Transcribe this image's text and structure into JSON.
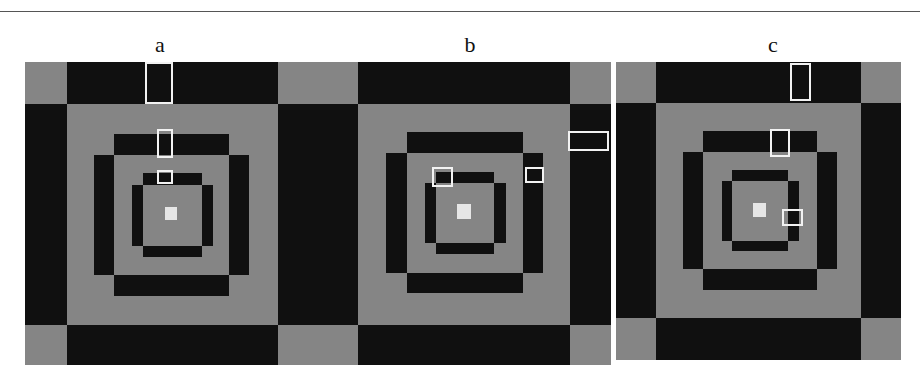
{
  "figure": {
    "panels": [
      {
        "id": "a",
        "label": "a"
      },
      {
        "id": "b",
        "label": "b"
      },
      {
        "id": "c",
        "label": "c"
      }
    ],
    "colors": {
      "gray": "#858585",
      "black": "#101010",
      "center": "#e6e6e6",
      "highlight_box": "#f2f2f2"
    },
    "highlight_box_counts": {
      "a": 3,
      "b": 3,
      "c": 2
    }
  }
}
